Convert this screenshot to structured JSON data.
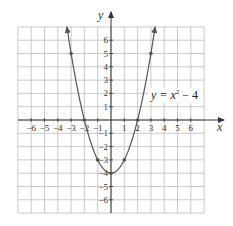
{
  "chart_data": {
    "type": "line",
    "title": "",
    "xlabel": "x",
    "ylabel": "y",
    "xlim": [
      -7,
      7
    ],
    "ylim": [
      -7,
      7
    ],
    "grid": true,
    "x_ticks": [
      -6,
      -5,
      -4,
      -3,
      -2,
      -1,
      1,
      2,
      3,
      4,
      5,
      6
    ],
    "y_ticks": [
      6,
      5,
      4,
      3,
      2,
      1,
      -1,
      -2,
      -3,
      -4,
      -5,
      -6
    ],
    "series": [
      {
        "name": "y = x^2 - 4",
        "function": "x^2 - 4",
        "color": "#555555",
        "marked_points": [
          {
            "x": -3,
            "y": 5
          },
          {
            "x": -2,
            "y": 0
          },
          {
            "x": -1,
            "y": -3
          },
          {
            "x": 0,
            "y": -4
          },
          {
            "x": 1,
            "y": -3
          },
          {
            "x": 2,
            "y": 0
          },
          {
            "x": 3,
            "y": 5
          }
        ]
      }
    ],
    "annotations": [
      {
        "text": "y = x² − 4",
        "position": "right of curve, near y=2"
      }
    ]
  },
  "labels": {
    "x_axis": "x",
    "y_axis": "y",
    "equation_base": "y = x",
    "equation_exp": "2",
    "equation_tail": " − 4"
  },
  "ticks": {
    "x": [
      "−6",
      "−5",
      "−4",
      "−3",
      "−2",
      "−1",
      "1",
      "2",
      "3",
      "4",
      "5",
      "6"
    ],
    "y": [
      "6",
      "5",
      "4",
      "3",
      "2",
      "1",
      "−1",
      "−2",
      "−3",
      "−4",
      "−5",
      "−6"
    ]
  },
  "colors": {
    "grid": "#bdbdbd",
    "axis": "#333333",
    "curve": "#555555"
  }
}
